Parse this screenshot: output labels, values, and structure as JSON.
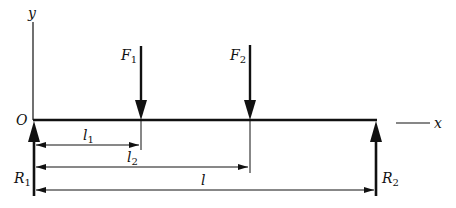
{
  "diagram": {
    "type": "simply-supported-beam-free-body",
    "colors": {
      "line": "#111111",
      "background": "#ffffff"
    },
    "axes": {
      "y_label": "y",
      "x_label": "x",
      "origin_label": "O"
    },
    "beam": {
      "x_start": 33,
      "x_end": 377,
      "y": 120
    },
    "loads": [
      {
        "name": "F",
        "sub": "1",
        "x": 141,
        "y_top": 46,
        "direction": "down"
      },
      {
        "name": "F",
        "sub": "2",
        "x": 250,
        "y_top": 45,
        "direction": "down"
      }
    ],
    "reactions": [
      {
        "name": "R",
        "sub": "1",
        "x": 34,
        "y_bottom": 196,
        "direction": "up"
      },
      {
        "name": "R",
        "sub": "2",
        "x": 376,
        "y_bottom": 196,
        "direction": "up"
      }
    ],
    "dimensions": [
      {
        "name": "l",
        "sub": "1",
        "from_x": 34,
        "to_x": 141,
        "y": 145
      },
      {
        "name": "l",
        "sub": "2",
        "from_x": 34,
        "to_x": 250,
        "y": 167
      },
      {
        "name": "l",
        "sub": "",
        "from_x": 34,
        "to_x": 376,
        "y": 190
      }
    ]
  },
  "labels": {
    "y": "y",
    "x": "x",
    "O": "O",
    "F1": "F",
    "F1_sub": "1",
    "F2": "F",
    "F2_sub": "2",
    "R1": "R",
    "R1_sub": "1",
    "R2": "R",
    "R2_sub": "2",
    "l1": "l",
    "l1_sub": "1",
    "l2": "l",
    "l2_sub": "2",
    "l": "l"
  }
}
